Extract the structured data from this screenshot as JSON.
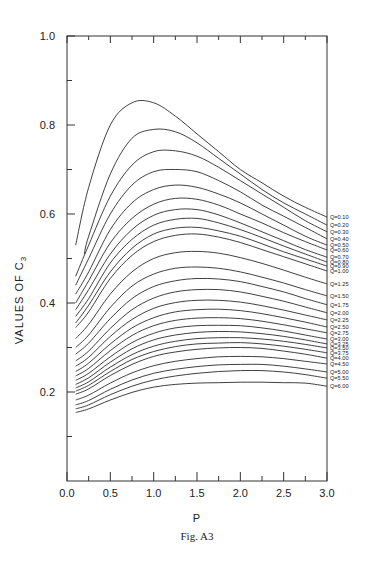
{
  "chart_data": {
    "type": "line",
    "title": "",
    "caption": "Fig. A3",
    "xlabel": "P",
    "ylabel": "VALUES OF C3",
    "xlim": [
      0.0,
      3.0
    ],
    "ylim": [
      0.0,
      1.0
    ],
    "xticks": [
      "0.0",
      "0.5",
      "1.0",
      "1.5",
      "2.0",
      "2.5",
      "3.0"
    ],
    "yticks": [
      "0.2",
      "0.4",
      "0.6",
      "0.8",
      "1.0"
    ],
    "grid": false,
    "legend_position": "right-inline",
    "x": [
      0.1,
      0.25,
      0.5,
      0.75,
      1.0,
      1.25,
      1.5,
      1.75,
      2.0,
      2.25,
      2.5,
      2.75,
      3.0
    ],
    "series": [
      {
        "name": "Q=0.10",
        "start_x": 0.1,
        "values": [
          0.53,
          0.66,
          0.8,
          0.85,
          0.85,
          0.82,
          0.78,
          0.74,
          0.7,
          0.67,
          0.64,
          0.615,
          0.593
        ]
      },
      {
        "name": "Q=0.20",
        "start_x": 0.2,
        "values": [
          null,
          0.55,
          0.69,
          0.77,
          0.79,
          0.785,
          0.76,
          0.725,
          0.69,
          0.655,
          0.625,
          0.6,
          0.575
        ]
      },
      {
        "name": "Q=0.30",
        "start_x": 0.1,
        "values": [
          0.46,
          0.53,
          0.64,
          0.71,
          0.74,
          0.742,
          0.73,
          0.705,
          0.675,
          0.645,
          0.615,
          0.585,
          0.56
        ]
      },
      {
        "name": "Q=0.40",
        "start_x": 0.1,
        "values": [
          0.44,
          0.5,
          0.6,
          0.665,
          0.695,
          0.7,
          0.695,
          0.675,
          0.65,
          0.62,
          0.595,
          0.57,
          0.544
        ]
      },
      {
        "name": "Q=0.50",
        "start_x": 0.1,
        "values": [
          0.42,
          0.47,
          0.565,
          0.625,
          0.655,
          0.665,
          0.66,
          0.645,
          0.625,
          0.6,
          0.575,
          0.55,
          0.53
        ]
      },
      {
        "name": "Q=0.60",
        "start_x": 0.1,
        "values": [
          0.4,
          0.45,
          0.535,
          0.59,
          0.622,
          0.635,
          0.633,
          0.62,
          0.6,
          0.58,
          0.558,
          0.538,
          0.519
        ]
      },
      {
        "name": "Q=0.70",
        "start_x": 0.1,
        "values": [
          0.385,
          0.43,
          0.51,
          0.565,
          0.597,
          0.61,
          0.61,
          0.598,
          0.58,
          0.56,
          0.54,
          0.52,
          0.503
        ]
      },
      {
        "name": "Q=0.80",
        "start_x": 0.1,
        "values": [
          0.37,
          0.41,
          0.49,
          0.543,
          0.575,
          0.588,
          0.59,
          0.58,
          0.565,
          0.547,
          0.528,
          0.51,
          0.492
        ]
      },
      {
        "name": "Q=0.90",
        "start_x": 0.1,
        "values": [
          0.355,
          0.395,
          0.47,
          0.523,
          0.555,
          0.568,
          0.57,
          0.562,
          0.55,
          0.533,
          0.515,
          0.499,
          0.483
        ]
      },
      {
        "name": "Q=1.00",
        "start_x": 0.1,
        "values": [
          0.345,
          0.38,
          0.455,
          0.507,
          0.538,
          0.552,
          0.555,
          0.548,
          0.536,
          0.52,
          0.504,
          0.488,
          0.472
        ]
      },
      {
        "name": "Q=1.25",
        "start_x": 0.1,
        "values": [
          0.32,
          0.352,
          0.42,
          0.47,
          0.5,
          0.513,
          0.516,
          0.512,
          0.502,
          0.489,
          0.474,
          0.458,
          0.443
        ]
      },
      {
        "name": "Q=1.50",
        "start_x": 0.1,
        "values": [
          0.3,
          0.328,
          0.39,
          0.438,
          0.465,
          0.478,
          0.481,
          0.478,
          0.47,
          0.458,
          0.445,
          0.43,
          0.416
        ]
      },
      {
        "name": "Q=1.75",
        "start_x": 0.1,
        "values": [
          0.285,
          0.31,
          0.365,
          0.41,
          0.437,
          0.45,
          0.455,
          0.454,
          0.448,
          0.437,
          0.425,
          0.41,
          0.396
        ]
      },
      {
        "name": "Q=2.00",
        "start_x": 0.1,
        "values": [
          0.27,
          0.292,
          0.343,
          0.385,
          0.411,
          0.425,
          0.43,
          0.43,
          0.425,
          0.415,
          0.404,
          0.391,
          0.378
        ]
      },
      {
        "name": "Q=2.25",
        "start_x": 0.1,
        "values": [
          0.258,
          0.278,
          0.325,
          0.363,
          0.388,
          0.401,
          0.406,
          0.406,
          0.402,
          0.394,
          0.384,
          0.373,
          0.362
        ]
      },
      {
        "name": "Q=2.50",
        "start_x": 0.1,
        "values": [
          0.246,
          0.265,
          0.308,
          0.344,
          0.367,
          0.38,
          0.385,
          0.386,
          0.383,
          0.376,
          0.367,
          0.357,
          0.346
        ]
      },
      {
        "name": "Q=2.75",
        "start_x": 0.1,
        "values": [
          0.236,
          0.253,
          0.293,
          0.327,
          0.349,
          0.361,
          0.366,
          0.367,
          0.365,
          0.359,
          0.351,
          0.342,
          0.333
        ]
      },
      {
        "name": "Q=3.00",
        "start_x": 0.1,
        "values": [
          0.226,
          0.242,
          0.279,
          0.311,
          0.332,
          0.344,
          0.349,
          0.35,
          0.349,
          0.344,
          0.337,
          0.328,
          0.319
        ]
      },
      {
        "name": "Q=3.25",
        "start_x": 0.1,
        "values": [
          0.217,
          0.232,
          0.267,
          0.297,
          0.317,
          0.328,
          0.334,
          0.336,
          0.335,
          0.331,
          0.325,
          0.317,
          0.308
        ]
      },
      {
        "name": "Q=3.50",
        "start_x": 0.1,
        "values": [
          0.209,
          0.223,
          0.256,
          0.284,
          0.303,
          0.314,
          0.32,
          0.322,
          0.322,
          0.319,
          0.314,
          0.307,
          0.299
        ]
      },
      {
        "name": "Q=3.75",
        "start_x": 0.1,
        "values": [
          0.202,
          0.215,
          0.246,
          0.273,
          0.291,
          0.302,
          0.308,
          0.31,
          0.311,
          0.308,
          0.303,
          0.296,
          0.288
        ]
      },
      {
        "name": "Q=4.00",
        "start_x": 0.1,
        "values": [
          0.195,
          0.207,
          0.237,
          0.262,
          0.28,
          0.29,
          0.296,
          0.299,
          0.3,
          0.298,
          0.292,
          0.285,
          0.276
        ]
      },
      {
        "name": "Q=4.50",
        "start_x": 0.1,
        "values": [
          0.182,
          0.193,
          0.22,
          0.243,
          0.259,
          0.269,
          0.275,
          0.279,
          0.28,
          0.279,
          0.275,
          0.269,
          0.263
        ]
      },
      {
        "name": "Q=5.00",
        "start_x": 0.1,
        "values": [
          0.171,
          0.181,
          0.206,
          0.227,
          0.242,
          0.251,
          0.257,
          0.261,
          0.262,
          0.262,
          0.258,
          0.252,
          0.245
        ]
      },
      {
        "name": "Q=5.50",
        "start_x": 0.1,
        "values": [
          0.162,
          0.171,
          0.194,
          0.213,
          0.227,
          0.236,
          0.242,
          0.246,
          0.248,
          0.248,
          0.245,
          0.239,
          0.231
        ]
      },
      {
        "name": "Q=6.00",
        "start_x": 0.1,
        "values": [
          0.154,
          0.162,
          0.182,
          0.199,
          0.211,
          0.217,
          0.22,
          0.221,
          0.222,
          0.222,
          0.221,
          0.22,
          0.213
        ]
      }
    ]
  },
  "labels": {
    "caption": "Fig. A3",
    "xlabel": "P",
    "ylabel_main": "VALUES OF C",
    "ylabel_sub": "3"
  }
}
